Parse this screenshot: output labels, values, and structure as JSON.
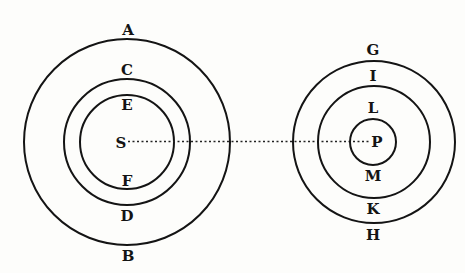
{
  "diagram": {
    "ink_color": "#141414",
    "background_color": "#fdfdfb",
    "systems": [
      {
        "name": "S-system",
        "center": {
          "x": 127,
          "y": 142
        },
        "center_label": "S",
        "circles": [
          {
            "r": 103,
            "top_label": "A",
            "bottom_label": "B"
          },
          {
            "r": 63,
            "top_label": "C",
            "bottom_label": "D"
          },
          {
            "r": 47,
            "top_label": "E",
            "bottom_label": "F"
          }
        ]
      },
      {
        "name": "P-system",
        "center": {
          "x": 373,
          "y": 142
        },
        "center_label": "P",
        "circles": [
          {
            "r": 80,
            "top_label": "G",
            "bottom_label": "H"
          },
          {
            "r": 55,
            "top_label": "I",
            "bottom_label": "K"
          },
          {
            "r": 23,
            "top_label": "L",
            "bottom_label": "M"
          }
        ]
      }
    ],
    "connector": {
      "from": "S",
      "to": "P",
      "style": "dotted"
    }
  }
}
